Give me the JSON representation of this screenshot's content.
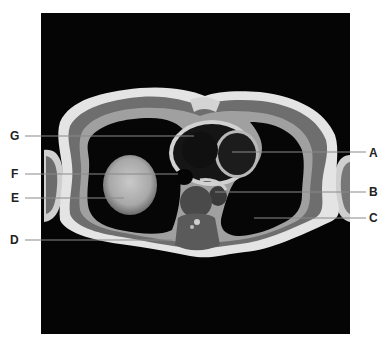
{
  "figure": {
    "colors": {
      "background": "#ffffff",
      "scan_background": "#050505",
      "label_text": "#222222",
      "leader_line": "#8a8a8a"
    }
  },
  "labels": {
    "left": [
      {
        "letter": "G"
      },
      {
        "letter": "F"
      },
      {
        "letter": "E"
      },
      {
        "letter": "D"
      }
    ],
    "right": [
      {
        "letter": "A"
      },
      {
        "letter": "B"
      },
      {
        "letter": "C"
      }
    ]
  }
}
